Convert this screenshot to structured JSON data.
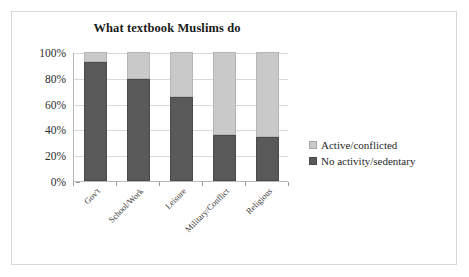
{
  "chart_data": {
    "type": "bar",
    "subtype": "stacked-100-percent",
    "title": "What textbook Muslims do",
    "xlabel": "",
    "ylabel": "",
    "ylim": [
      0,
      100
    ],
    "yticks": [
      "0%",
      "20%",
      "40%",
      "60%",
      "80%",
      "100%"
    ],
    "ytick_values": [
      0,
      20,
      40,
      60,
      80,
      100
    ],
    "grid": true,
    "legend_position": "right",
    "categories": [
      "Gov't",
      "School/Work",
      "Leisure",
      "Military/Conflict",
      "Religious"
    ],
    "series": [
      {
        "name": "No activity/sedentary",
        "color": "#595959",
        "values": [
          92,
          79,
          65,
          36,
          34
        ]
      },
      {
        "name": "Active/conflicted",
        "color": "#c9c9c9",
        "values": [
          8,
          21,
          35,
          64,
          66
        ]
      }
    ]
  },
  "legend": {
    "entries": [
      {
        "label": "Active/conflicted",
        "swatch": "light-gray-swatch-icon"
      },
      {
        "label": "No activity/sedentary",
        "swatch": "dark-gray-swatch-icon"
      }
    ]
  }
}
